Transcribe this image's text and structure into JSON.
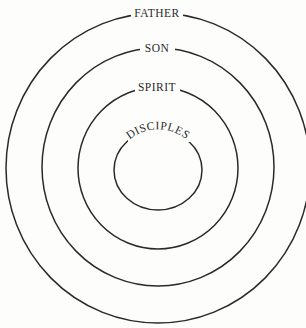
{
  "diagram": {
    "type": "concentric-circles",
    "center": {
      "x": 158,
      "y": 168
    },
    "rings": [
      {
        "label": "FATHER",
        "radius": 155
      },
      {
        "label": "SON",
        "radius": 119
      },
      {
        "label": "SPIRIT",
        "radius": 81
      },
      {
        "label": "DISCIPLES",
        "radius": 41
      }
    ],
    "colors": {
      "stroke": "#2a2a2a",
      "background": "#fdfdfc"
    }
  }
}
